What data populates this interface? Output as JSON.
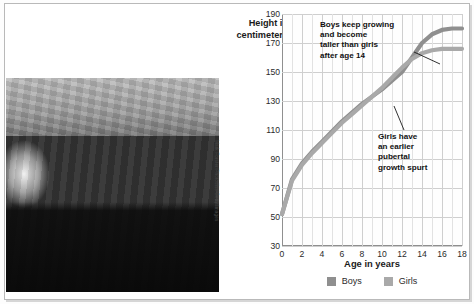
{
  "figure": {
    "photo_credit": "Mark Forster/Photodisc/Getty Images",
    "photo_alt": "group-of-teenagers-photo"
  },
  "colors": {
    "boys": "#8f8f8f",
    "girls": "#a9a9a9",
    "grid": "#cfcfcf",
    "axis": "#8f8f8f",
    "text": "#1b1b1b"
  },
  "chart_data": {
    "type": "line",
    "title": "",
    "xlabel": "Age in years",
    "ylabel": "Height in centimeters",
    "xlim": [
      0,
      18
    ],
    "ylim": [
      30,
      190
    ],
    "xticks": [
      "0",
      "2",
      "4",
      "6",
      "8",
      "10",
      "12",
      "14",
      "16",
      "18"
    ],
    "yticks": [
      "190",
      "170",
      "150",
      "130",
      "110",
      "90",
      "70",
      "50",
      "30"
    ],
    "grid": true,
    "legend_position": "bottom",
    "x": [
      0,
      1,
      2,
      3,
      4,
      5,
      6,
      7,
      8,
      9,
      10,
      11,
      12,
      13,
      14,
      15,
      16,
      17,
      18
    ],
    "series": [
      {
        "name": "Boys",
        "color": "#8f8f8f",
        "values": [
          52,
          76,
          87,
          95,
          102,
          109,
          116,
          122,
          128,
          133,
          138,
          144,
          150,
          160,
          170,
          176,
          179,
          180,
          180
        ]
      },
      {
        "name": "Girls",
        "color": "#a9a9a9",
        "values": [
          52,
          75,
          86,
          94,
          101,
          108,
          115,
          121,
          127,
          133,
          139,
          146,
          153,
          159,
          163,
          165,
          166,
          166,
          166
        ]
      }
    ],
    "annotations": [
      {
        "id": "boys-annotation",
        "text": "Boys keep growing\nand become\ntaller than girls\nafter age 14"
      },
      {
        "id": "girls-annotation",
        "text": "Girls have\nan earlier\npubertal\ngrowth spurt"
      }
    ]
  }
}
